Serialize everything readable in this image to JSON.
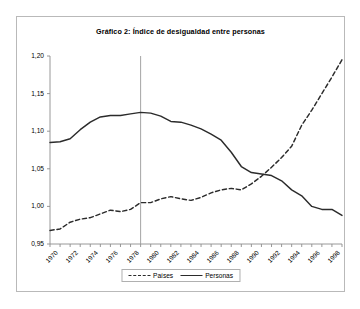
{
  "figure": {
    "title": "Gráfico 2: Índice de desigualdad entre personas",
    "frame_color": "#b9b9b9",
    "background": "#ffffff"
  },
  "legend": {
    "position": "bottom-center",
    "entries": [
      {
        "label": "Países",
        "style": "dashed",
        "color": "#2b2b2b",
        "swatch": "dashed-line-swatch"
      },
      {
        "label": "Personas",
        "style": "solid",
        "color": "#2b2b2b",
        "swatch": "solid-line-swatch"
      }
    ]
  },
  "axes": {
    "y_ticks": [
      "0,95",
      "1,00",
      "1,05",
      "1,10",
      "1,15",
      "1,20"
    ],
    "x_ticks": [
      "1970",
      "1972",
      "1974",
      "1976",
      "1978",
      "1980",
      "1982",
      "1984",
      "1986",
      "1988",
      "1990",
      "1992",
      "1994",
      "1996",
      "1998"
    ]
  },
  "annotations": {
    "vertical_reference_line_year": 1979,
    "vertical_reference_line_color": "#9a9a9a"
  },
  "chart_data": {
    "type": "line",
    "title": "Gráfico 2: Índice de desigualdad entre personas",
    "xlabel": "",
    "ylabel": "",
    "xlim": [
      1970,
      1999
    ],
    "ylim": [
      0.95,
      1.2
    ],
    "y_tick_values": [
      0.95,
      1.0,
      1.05,
      1.1,
      1.15,
      1.2
    ],
    "y_tick_labels": [
      "0,95",
      "1,00",
      "1,05",
      "1,10",
      "1,15",
      "1,20"
    ],
    "x_tick_values": [
      1970,
      1972,
      1974,
      1976,
      1978,
      1980,
      1982,
      1984,
      1986,
      1988,
      1990,
      1992,
      1994,
      1996,
      1998
    ],
    "x_tick_labels": [
      "1970",
      "1972",
      "1974",
      "1976",
      "1978",
      "1980",
      "1982",
      "1984",
      "1986",
      "1988",
      "1990",
      "1992",
      "1994",
      "1996",
      "1998"
    ],
    "grid": false,
    "legend_position": "bottom-center",
    "x": [
      1970,
      1971,
      1972,
      1973,
      1974,
      1975,
      1976,
      1977,
      1978,
      1979,
      1980,
      1981,
      1982,
      1983,
      1984,
      1985,
      1986,
      1987,
      1988,
      1989,
      1990,
      1991,
      1992,
      1993,
      1994,
      1995,
      1996,
      1997,
      1998,
      1999
    ],
    "series": [
      {
        "name": "Países",
        "style": "dashed",
        "color": "#2b2b2b",
        "values": [
          0.968,
          0.97,
          0.979,
          0.983,
          0.985,
          0.99,
          0.995,
          0.993,
          0.996,
          1.005,
          1.005,
          1.01,
          1.013,
          1.01,
          1.008,
          1.012,
          1.018,
          1.022,
          1.024,
          1.022,
          1.03,
          1.04,
          1.052,
          1.065,
          1.08,
          1.108,
          1.128,
          1.15,
          1.172,
          1.195
        ]
      },
      {
        "name": "Personas",
        "style": "solid",
        "color": "#2b2b2b",
        "values": [
          1.085,
          1.086,
          1.09,
          1.102,
          1.112,
          1.119,
          1.121,
          1.121,
          1.123,
          1.125,
          1.124,
          1.12,
          1.113,
          1.112,
          1.108,
          1.103,
          1.096,
          1.088,
          1.072,
          1.053,
          1.045,
          1.043,
          1.041,
          1.034,
          1.022,
          1.014,
          1.0,
          0.996,
          0.996,
          0.988
        ]
      }
    ]
  }
}
